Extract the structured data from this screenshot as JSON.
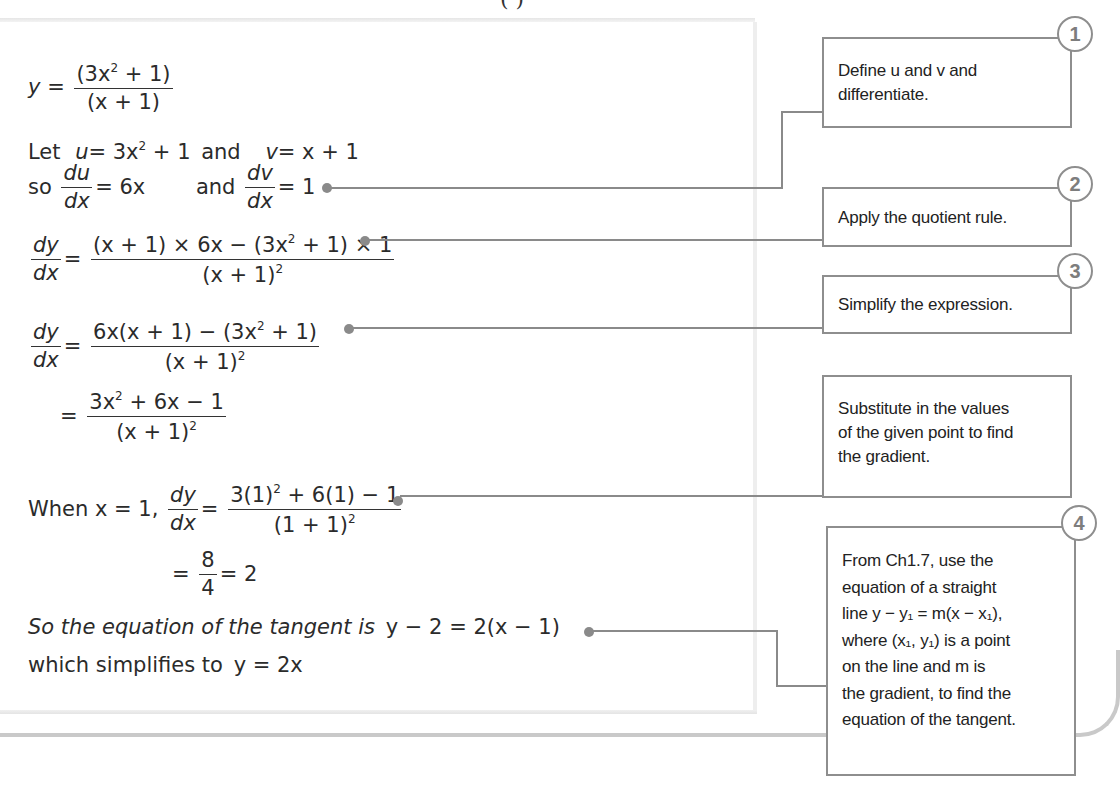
{
  "header": {
    "title_fragment": "(   )"
  },
  "worked_solution": {
    "line1": {
      "lhs": "y",
      "eq": "=",
      "num": "(3x² + 1)",
      "num_base": "(3x",
      "num_exp": "2",
      "num_tail": " + 1)",
      "den": "(x + 1)"
    },
    "line2": {
      "prefix": "Let",
      "u_def": "u = 3x² + 1",
      "u_lhs": "u",
      "u_rhs_base": "= 3x",
      "u_rhs_exp": "2",
      "u_rhs_tail": " + 1",
      "joiner": "and",
      "v_lhs": "v",
      "v_rhs": "= x + 1"
    },
    "line3": {
      "prefix": "so",
      "du_num": "du",
      "du_den": "dx",
      "du_rhs": "= 6x",
      "joiner": "and",
      "dv_num": "dv",
      "dv_den": "dx",
      "dv_rhs": "= 1"
    },
    "line4": {
      "lhs_num": "dy",
      "lhs_den": "dx",
      "eq": "=",
      "num_a": "(x + 1) × 6x − (3x",
      "num_exp": "2",
      "num_b": " + 1) × 1",
      "den_base": "(x + 1)",
      "den_exp": "2"
    },
    "line5": {
      "lhs_num": "dy",
      "lhs_den": "dx",
      "eq": "=",
      "num_a": "6x(x + 1) − (3x",
      "num_exp": "2",
      "num_b": " + 1)",
      "den_base": "(x + 1)",
      "den_exp": "2"
    },
    "line6": {
      "eq": "=",
      "num_a": "3x",
      "num_exp": "2",
      "num_b": " + 6x − 1",
      "den_base": "(x + 1)",
      "den_exp": "2"
    },
    "line7": {
      "prefix": "When x = 1,",
      "lhs_num": "dy",
      "lhs_den": "dx",
      "eq": "=",
      "num_a": "3(1)",
      "num_exp": "2",
      "num_b": " + 6(1) − 1",
      "den_base": "(1 + 1)",
      "den_exp": "2"
    },
    "line8": {
      "eq": "=",
      "num": "8",
      "den": "4",
      "result": "= 2"
    },
    "line9": {
      "text": "So the equation of the tangent is",
      "equation": "y − 2 = 2(x − 1)"
    },
    "line10": {
      "text": "which simplifies to",
      "equation": "y = 2x"
    }
  },
  "callouts": [
    {
      "number": "1",
      "lines": [
        "Define u and v and",
        "differentiate."
      ]
    },
    {
      "number": "2",
      "lines": [
        "Apply the quotient rule."
      ]
    },
    {
      "number": "3",
      "lines": [
        "Simplify the expression."
      ]
    },
    {
      "number": "",
      "lines": [
        "Substitute in the values",
        "of the given point to find",
        "the gradient."
      ]
    },
    {
      "number": "4",
      "lines": [
        "From Ch1.7, use the",
        "equation of a straight",
        "line y − y₁ = m(x − x₁),",
        "where (x₁, y₁) is a point",
        "on the line and m is",
        "the gradient, to find the",
        "equation of the tangent."
      ]
    }
  ],
  "colors": {
    "connector": "#8a8a8a",
    "box_border": "#8e8e8e",
    "badge_text": "#7d7d7d",
    "text": "#2b2b2b",
    "frame": "#c9c9c9"
  }
}
